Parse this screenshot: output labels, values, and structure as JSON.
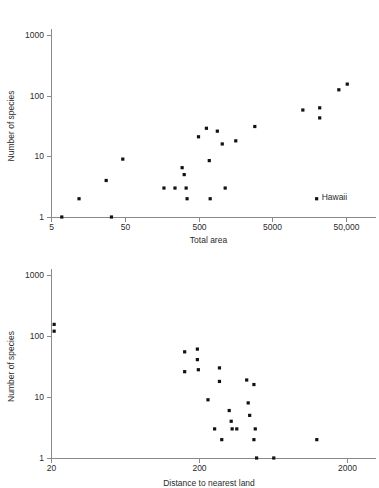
{
  "chart_data": [
    {
      "id": "species-vs-area",
      "type": "scatter",
      "title": "",
      "xlabel": "Total area",
      "ylabel": "Number of species",
      "xscale": "log",
      "yscale": "log",
      "xlim": [
        5,
        63000
      ],
      "ylim": [
        1,
        1500
      ],
      "xticks": [
        5,
        50,
        500,
        5000,
        50000
      ],
      "xticklabels": [
        "5",
        "50",
        "500",
        "5000",
        "50,000"
      ],
      "yticks": [
        1,
        10,
        100,
        1000
      ],
      "yticklabels": [
        "1",
        "10",
        "100",
        "1000"
      ],
      "grid": false,
      "legend": false,
      "marker": "square",
      "marker_color": "#111111",
      "points": [
        {
          "x": 7,
          "y": 1
        },
        {
          "x": 12,
          "y": 2
        },
        {
          "x": 28,
          "y": 4
        },
        {
          "x": 33,
          "y": 1
        },
        {
          "x": 47,
          "y": 9
        },
        {
          "x": 170,
          "y": 3
        },
        {
          "x": 240,
          "y": 3
        },
        {
          "x": 300,
          "y": 6.5
        },
        {
          "x": 320,
          "y": 5
        },
        {
          "x": 340,
          "y": 3
        },
        {
          "x": 350,
          "y": 2
        },
        {
          "x": 500,
          "y": 21
        },
        {
          "x": 640,
          "y": 29
        },
        {
          "x": 700,
          "y": 8.5
        },
        {
          "x": 720,
          "y": 2
        },
        {
          "x": 900,
          "y": 26
        },
        {
          "x": 1050,
          "y": 16
        },
        {
          "x": 1150,
          "y": 3
        },
        {
          "x": 1600,
          "y": 18
        },
        {
          "x": 2900,
          "y": 31
        },
        {
          "x": 13000,
          "y": 58
        },
        {
          "x": 20000,
          "y": 2
        },
        {
          "x": 22000,
          "y": 63
        },
        {
          "x": 22000,
          "y": 43
        },
        {
          "x": 40000,
          "y": 125
        },
        {
          "x": 52000,
          "y": 155
        }
      ],
      "annotations": [
        {
          "text": "Hawaii",
          "x": 20000,
          "y": 2,
          "dx": 5,
          "dy": -1
        }
      ]
    },
    {
      "id": "species-vs-distance",
      "type": "scatter",
      "title": "",
      "xlabel": "Distance to nearest land",
      "ylabel": "Number of species",
      "xscale": "log",
      "yscale": "log",
      "xlim": [
        20,
        3200
      ],
      "ylim": [
        1,
        1500
      ],
      "xticks": [
        20,
        200,
        2000
      ],
      "xticklabels": [
        "20",
        "200",
        "2000"
      ],
      "yticks": [
        1,
        10,
        100,
        1000
      ],
      "yticklabels": [
        "1",
        "10",
        "100",
        "1000"
      ],
      "grid": false,
      "legend": false,
      "marker": "square",
      "marker_color": "#111111",
      "points": [
        {
          "x": 21,
          "y": 155
        },
        {
          "x": 21,
          "y": 120
        },
        {
          "x": 160,
          "y": 55
        },
        {
          "x": 160,
          "y": 26
        },
        {
          "x": 195,
          "y": 61
        },
        {
          "x": 195,
          "y": 41
        },
        {
          "x": 198,
          "y": 28
        },
        {
          "x": 230,
          "y": 9
        },
        {
          "x": 255,
          "y": 3
        },
        {
          "x": 275,
          "y": 30
        },
        {
          "x": 275,
          "y": 18
        },
        {
          "x": 285,
          "y": 2
        },
        {
          "x": 320,
          "y": 6
        },
        {
          "x": 330,
          "y": 4
        },
        {
          "x": 335,
          "y": 3
        },
        {
          "x": 360,
          "y": 3
        },
        {
          "x": 420,
          "y": 19
        },
        {
          "x": 430,
          "y": 8
        },
        {
          "x": 440,
          "y": 5
        },
        {
          "x": 470,
          "y": 16
        },
        {
          "x": 480,
          "y": 3
        },
        {
          "x": 470,
          "y": 2
        },
        {
          "x": 490,
          "y": 1
        },
        {
          "x": 640,
          "y": 1
        },
        {
          "x": 1250,
          "y": 2
        }
      ],
      "annotations": []
    }
  ],
  "style": {
    "background": "#ffffff",
    "axis_color": "#8a8a8a",
    "text_color": "#2b2b2b",
    "marker_color": "#111111"
  }
}
